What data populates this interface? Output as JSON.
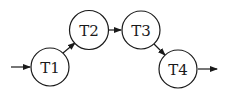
{
  "diagram": {
    "type": "state-transition-chain",
    "nodes": [
      {
        "id": "T1",
        "label": "T1",
        "cx": 50,
        "cy": 67
      },
      {
        "id": "T2",
        "label": "T2",
        "cx": 89,
        "cy": 30
      },
      {
        "id": "T3",
        "label": "T3",
        "cx": 141,
        "cy": 30
      },
      {
        "id": "T4",
        "label": "T4",
        "cx": 178,
        "cy": 69
      }
    ],
    "edges": [
      {
        "from": "start",
        "to": "T1"
      },
      {
        "from": "T1",
        "to": "T2"
      },
      {
        "from": "T2",
        "to": "T3"
      },
      {
        "from": "T3",
        "to": "T4"
      },
      {
        "from": "T4",
        "to": "end"
      }
    ],
    "colors": {
      "stroke": "#1a1a1a",
      "fill": "#ffffff"
    }
  }
}
